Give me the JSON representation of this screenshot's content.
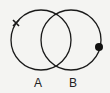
{
  "diagram": {
    "type": "venn",
    "sets": [
      {
        "label": "A",
        "cx": 41,
        "cy": 40,
        "r": 30
      },
      {
        "label": "B",
        "cx": 71,
        "cy": 40,
        "r": 30
      }
    ],
    "markers": [
      {
        "type": "cross",
        "on": "A",
        "x": 16,
        "y": 23
      },
      {
        "type": "dot",
        "on": "B",
        "x": 99,
        "y": 47
      }
    ],
    "stroke_color": "#1a1a1a",
    "background": "#f4f4f2"
  }
}
